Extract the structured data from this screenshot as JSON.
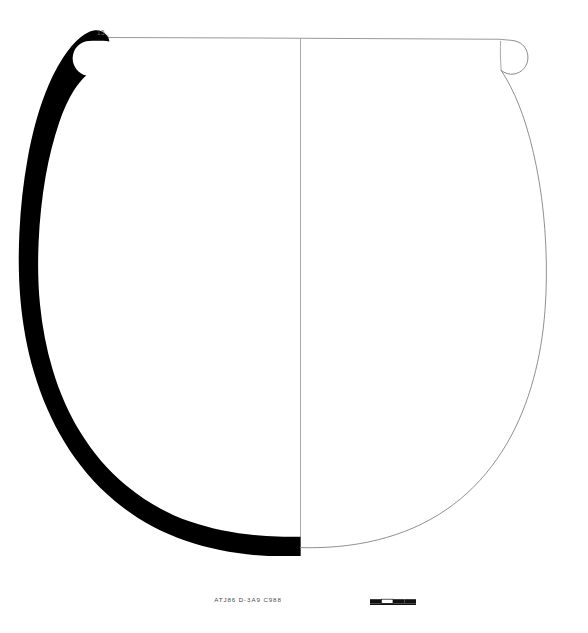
{
  "figure": {
    "type": "archaeological-pottery-profile-drawing",
    "caption": "ATJ86 D-3A9 C988",
    "rim_diameter_label": "15",
    "orientation": "section-left / elevation-right",
    "colors": {
      "section_fill": "#000000",
      "outline": "#8a8a8a",
      "rim_line": "#9a9a9a",
      "axis_line": "#a8a8a8",
      "background": "#ffffff",
      "caption_text": "#4a4a4a",
      "scale_bar_fill": "#111111"
    },
    "geometry": {
      "rim_line_y": 38,
      "rim_line_x_start": 108,
      "rim_line_x_end": 512,
      "axis_x": 300,
      "axis_y_top": 38,
      "axis_y_bottom": 556,
      "base_y": 556,
      "left_max_x": 38,
      "right_max_x": 550,
      "max_width_y": 330,
      "wall_thickness_px": 13
    },
    "scale_bar": {
      "x": 370,
      "y": 599,
      "width": 46,
      "height": 5,
      "segments": 4,
      "label": ""
    }
  }
}
